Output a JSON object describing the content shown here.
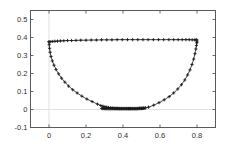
{
  "chart_data": {
    "type": "line",
    "title": "",
    "subtitle": "",
    "xlabel": "",
    "ylabel": "",
    "xlim": [
      -0.1,
      0.9
    ],
    "ylim": [
      -0.1,
      0.55
    ],
    "xticks": [
      0,
      0.2,
      0.4,
      0.6,
      0.8
    ],
    "xtick_labels": [
      "0",
      "0.2",
      "0.4",
      "0.6",
      "0.8"
    ],
    "yticks": [
      -0.1,
      0,
      0.1,
      0.2,
      0.3,
      0.4,
      0.5
    ],
    "ytick_labels": [
      "-0.1",
      "0",
      "0.1",
      "0.2",
      "0.3",
      "0.4",
      "0.5"
    ],
    "grid": true,
    "gridlines": [
      {
        "axis": "x",
        "value": 0
      },
      {
        "axis": "y",
        "value": 0
      }
    ],
    "legend": null,
    "legend_position": "none",
    "marker": "plus",
    "marker_color": "#1a1a1a",
    "line_color": "#2b2b2b",
    "axis_color": "#595959",
    "grid_color": "#d9d9d9",
    "background": "#ffffff",
    "series": [
      {
        "name": "top-chord",
        "style": "line-with-markers",
        "x": [
          0.0,
          0.01,
          0.02,
          0.032,
          0.046,
          0.062,
          0.08,
          0.1,
          0.122,
          0.146,
          0.172,
          0.2,
          0.228,
          0.256,
          0.284,
          0.312,
          0.34,
          0.368,
          0.396,
          0.424,
          0.452,
          0.48,
          0.508,
          0.536,
          0.564,
          0.592,
          0.62,
          0.648,
          0.674,
          0.698,
          0.72,
          0.74,
          0.758,
          0.774,
          0.788,
          0.795,
          0.8
        ],
        "y": [
          0.376,
          0.377,
          0.378,
          0.379,
          0.38,
          0.381,
          0.382,
          0.383,
          0.383,
          0.384,
          0.385,
          0.385,
          0.386,
          0.386,
          0.387,
          0.387,
          0.387,
          0.388,
          0.388,
          0.388,
          0.388,
          0.388,
          0.388,
          0.388,
          0.388,
          0.388,
          0.388,
          0.388,
          0.388,
          0.388,
          0.388,
          0.388,
          0.388,
          0.387,
          0.387,
          0.387,
          0.386
        ]
      },
      {
        "name": "bottom-arc",
        "style": "line-with-markers",
        "x": [
          0.0,
          0.001,
          0.003,
          0.006,
          0.011,
          0.018,
          0.027,
          0.038,
          0.052,
          0.068,
          0.086,
          0.106,
          0.128,
          0.152,
          0.178,
          0.205,
          0.233,
          0.262,
          0.28,
          0.292,
          0.302,
          0.312,
          0.322,
          0.332,
          0.342,
          0.352,
          0.362,
          0.372,
          0.382,
          0.392,
          0.4,
          0.41,
          0.42,
          0.43,
          0.44,
          0.45,
          0.46,
          0.47,
          0.48,
          0.49,
          0.5,
          0.51,
          0.522,
          0.538,
          0.566,
          0.595,
          0.623,
          0.65,
          0.674,
          0.696,
          0.716,
          0.734,
          0.749,
          0.762,
          0.773,
          0.782,
          0.789,
          0.794,
          0.797,
          0.799,
          0.8
        ],
        "y": [
          0.376,
          0.36,
          0.34,
          0.318,
          0.294,
          0.27,
          0.246,
          0.222,
          0.198,
          0.174,
          0.152,
          0.13,
          0.11,
          0.092,
          0.074,
          0.058,
          0.044,
          0.03,
          0.022,
          0.018,
          0.015,
          0.013,
          0.011,
          0.009,
          0.008,
          0.007,
          0.006,
          0.006,
          0.005,
          0.005,
          0.005,
          0.005,
          0.005,
          0.005,
          0.005,
          0.005,
          0.005,
          0.005,
          0.005,
          0.006,
          0.006,
          0.007,
          0.009,
          0.013,
          0.024,
          0.038,
          0.054,
          0.072,
          0.092,
          0.114,
          0.138,
          0.164,
          0.192,
          0.22,
          0.25,
          0.28,
          0.31,
          0.336,
          0.356,
          0.37,
          0.376
        ]
      },
      {
        "name": "dense-cluster-bottom",
        "style": "markers",
        "x": [
          0.285,
          0.29,
          0.295,
          0.3,
          0.305,
          0.31,
          0.315,
          0.32,
          0.325,
          0.33,
          0.335,
          0.34,
          0.345,
          0.35,
          0.355,
          0.36,
          0.365,
          0.37,
          0.375,
          0.38,
          0.385,
          0.39,
          0.395,
          0.4,
          0.405,
          0.41,
          0.415,
          0.42,
          0.425,
          0.43,
          0.435,
          0.44,
          0.445,
          0.45,
          0.455,
          0.46,
          0.465,
          0.47,
          0.475,
          0.48,
          0.485,
          0.49,
          0.495,
          0.5,
          0.505,
          0.51,
          0.515
        ],
        "y": [
          0.006,
          0.006,
          0.006,
          0.006,
          0.005,
          0.005,
          0.005,
          0.005,
          0.005,
          0.005,
          0.005,
          0.005,
          0.005,
          0.005,
          0.005,
          0.005,
          0.005,
          0.005,
          0.005,
          0.005,
          0.005,
          0.005,
          0.005,
          0.005,
          0.005,
          0.005,
          0.005,
          0.005,
          0.005,
          0.005,
          0.005,
          0.005,
          0.005,
          0.005,
          0.005,
          0.005,
          0.005,
          0.005,
          0.005,
          0.005,
          0.006,
          0.006,
          0.006,
          0.006,
          0.006,
          0.007,
          0.007
        ]
      }
    ]
  }
}
